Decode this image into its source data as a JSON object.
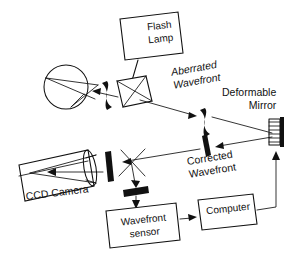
{
  "figure": {
    "background_color": "#ffffff",
    "ink_color": "#111111",
    "width": 307,
    "height": 254
  },
  "labels": {
    "flash_lamp_line1": "Flash",
    "flash_lamp_line2": "Lamp",
    "aberrated_line1": "Aberrated",
    "aberrated_line2": "Wavefront",
    "deformable_line1": "Deformable",
    "deformable_line2": "Mirror",
    "corrected_line1": "Corrected",
    "corrected_line2": "Wavefront",
    "ccd_camera": "CCD  Camera",
    "wavefront_sensor_line1": "Wavefront",
    "wavefront_sensor_line2": "sensor",
    "computer": "Computer"
  },
  "components": [
    {
      "id": "flash-lamp",
      "name": "Flash Lamp",
      "shape": "tilted-box"
    },
    {
      "id": "eye",
      "name": "Eye",
      "shape": "circle-with-rays"
    },
    {
      "id": "aberrated-wavefront-marker",
      "name": "Aberrated wavefront",
      "shape": "s-curve"
    },
    {
      "id": "beamsplitter-cube",
      "name": "Beamsplitter cube",
      "shape": "tilted-square-with-diagonals"
    },
    {
      "id": "aberrated-wavefront-marker-2",
      "name": "Aberrated wavefront",
      "shape": "s-curve"
    },
    {
      "id": "corrected-wavefront-marker",
      "name": "Corrected wavefront",
      "shape": "straight-bar"
    },
    {
      "id": "deformable-mirror",
      "name": "Deformable mirror",
      "shape": "actuator-comb-with-bar"
    },
    {
      "id": "ccd-camera",
      "name": "CCD camera",
      "shape": "tilted-rectangle"
    },
    {
      "id": "camera-lens",
      "name": "Camera lens",
      "shape": "ellipse"
    },
    {
      "id": "fold-mirror-camera",
      "name": "Fold mirror",
      "shape": "thick-bar"
    },
    {
      "id": "beamsplitter-x",
      "name": "Beamsplitter",
      "shape": "x-cross"
    },
    {
      "id": "fold-mirror-sensor",
      "name": "Fold mirror",
      "shape": "thick-bar"
    },
    {
      "id": "wavefront-sensor",
      "name": "Wavefront sensor",
      "shape": "tilted-box"
    },
    {
      "id": "computer",
      "name": "Computer",
      "shape": "tilted-box"
    }
  ],
  "beam_paths": [
    {
      "from": "flash-lamp",
      "to": "beamsplitter-cube",
      "arrow": true
    },
    {
      "from": "beamsplitter-cube",
      "to": "eye",
      "arrow": true
    },
    {
      "from": "beamsplitter-cube",
      "to": "aberrated-wavefront-marker-2",
      "arrow": true
    },
    {
      "from": "aberrated-wavefront-marker-2",
      "to": "deformable-mirror",
      "arrow": false
    },
    {
      "from": "deformable-mirror",
      "to": "corrected-wavefront-marker",
      "arrow": true
    },
    {
      "from": "corrected-wavefront-marker",
      "to": "fold-mirror-camera",
      "arrow": true
    },
    {
      "from": "fold-mirror-camera",
      "to": "ccd-camera",
      "arrow": true
    },
    {
      "from": "beamsplitter-x",
      "to": "fold-mirror-sensor",
      "arrow": true
    },
    {
      "from": "fold-mirror-sensor",
      "to": "wavefront-sensor",
      "arrow": true
    },
    {
      "from": "wavefront-sensor",
      "to": "computer",
      "arrow": true
    },
    {
      "from": "computer",
      "to": "deformable-mirror",
      "arrow": true
    }
  ]
}
